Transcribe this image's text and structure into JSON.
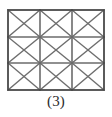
{
  "figure": {
    "caption": "(3)",
    "shape": "rectangle",
    "grid": {
      "columns": 3,
      "rows": 3,
      "cell_diagonals": "both",
      "cells_total": 9
    },
    "geometry": {
      "left": 8,
      "top": 10,
      "right": 104,
      "bottom": 90,
      "width": 96,
      "height": 80,
      "column_x": [
        8,
        40,
        72,
        104
      ],
      "row_y": [
        10,
        37,
        63,
        90
      ]
    },
    "colors": {
      "background": "#ffffff",
      "border": "#4a4a4a",
      "grid_line": "#6b6b6b",
      "diagonal_line": "#6e6e6e",
      "caption_text": "#2b2b2b"
    },
    "stroke": {
      "border_width": 1.8,
      "grid_width": 1.6,
      "diagonal_width": 1.4
    }
  }
}
